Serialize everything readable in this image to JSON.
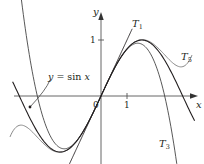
{
  "chart_data": {
    "type": "line",
    "title": "",
    "xlabel": "x",
    "ylabel": "y",
    "x_ticks": [
      {
        "value": 1,
        "label": "1"
      }
    ],
    "y_ticks": [
      {
        "value": 1,
        "label": "1"
      }
    ],
    "origin_label": "0",
    "xlim": [
      -3.4,
      3.6
    ],
    "ylim": [
      -1.3,
      1.7
    ],
    "grid": false,
    "series": [
      {
        "name": "y = sin x",
        "expr": "sin(x)",
        "domain": [
          -3.4,
          3.6
        ]
      },
      {
        "name": "T1",
        "expr": "x",
        "domain": [
          -1.3,
          1.2
        ]
      },
      {
        "name": "T3",
        "expr": "x - x^3/6",
        "domain": [
          -3.1,
          2.95
        ]
      },
      {
        "name": "T5",
        "expr": "x - x^3/6 + x^5/120",
        "domain": [
          -3.5,
          3.5
        ]
      }
    ],
    "annotations": [
      {
        "text": "y = sin x",
        "points_to": "sin x curve",
        "position": "upper-left"
      },
      {
        "text": "T1",
        "position": "near top of tangent line"
      },
      {
        "text": "T3",
        "position": "lower right"
      },
      {
        "text": "T5",
        "position": "right"
      }
    ]
  },
  "labels": {
    "x_axis": "x",
    "y_axis": "y",
    "origin": "0",
    "x_tick_1": "1",
    "y_tick_1": "1",
    "sin_label": "y = sin x",
    "t1": "T",
    "t1_sub": "1",
    "t3": "T",
    "t3_sub": "3",
    "t5": "T",
    "t5_sub": "5"
  },
  "colors": {
    "sin": "#231f20",
    "t1": "#231f20",
    "t3": "#3a3a3a",
    "t5": "#8a8a8a",
    "axis": "#555555"
  }
}
